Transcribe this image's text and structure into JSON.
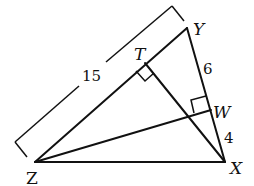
{
  "diagram": {
    "type": "triangle with altitudes",
    "vertices": [
      {
        "label": "Z",
        "x": 35,
        "y": 162
      },
      {
        "label": "X",
        "x": 225,
        "y": 162
      },
      {
        "label": "Y",
        "x": 187,
        "y": 28
      }
    ],
    "feet": [
      {
        "label": "T",
        "on_segment": "ZY",
        "x": 144,
        "y": 63,
        "right_angle": true
      },
      {
        "label": "W",
        "on_segment": "YX",
        "x": 210,
        "y": 109,
        "right_angle": true
      }
    ],
    "segments": [
      "ZX",
      "ZY",
      "YX",
      "XT",
      "ZW"
    ],
    "measurements": [
      {
        "segment": "ZY",
        "value": "15",
        "style": "bracket"
      },
      {
        "segment": "YW",
        "value": "6"
      },
      {
        "segment": "WX",
        "value": "4"
      }
    ],
    "colors": {
      "stroke": "#111111",
      "background": "#ffffff"
    }
  },
  "labels": {
    "Y": "Y",
    "T": "T",
    "W": "W",
    "X": "X",
    "Z": "Z",
    "len_ZY": "15",
    "len_YW": "6",
    "len_WX": "4"
  }
}
